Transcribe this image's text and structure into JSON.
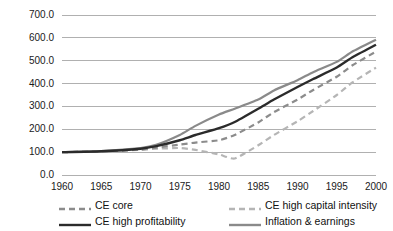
{
  "chart_data": {
    "type": "line",
    "title": "",
    "xlabel": "",
    "ylabel": "",
    "xlim": [
      1960,
      2000
    ],
    "ylim": [
      0,
      700
    ],
    "grid": true,
    "legend_position": "bottom",
    "x": [
      1960,
      1965,
      1970,
      1972,
      1975,
      1977,
      1980,
      1982,
      1985,
      1987,
      1990,
      1992,
      1995,
      1997,
      2000
    ],
    "y_ticks": [
      "0.0",
      "100.0",
      "200.0",
      "300.0",
      "400.0",
      "500.0",
      "600.0",
      "700.0"
    ],
    "y_tick_values": [
      0,
      100,
      200,
      300,
      400,
      500,
      600,
      700
    ],
    "x_ticks": [
      "1960",
      "1965",
      "1970",
      "1975",
      "1980",
      "1985",
      "1990",
      "1995",
      "2000"
    ],
    "x_tick_values": [
      1960,
      1965,
      1970,
      1975,
      1980,
      1985,
      1990,
      1995,
      2000
    ],
    "series": [
      {
        "name": "CE core",
        "style": "dashed",
        "color": "#8c8c8c",
        "width": 2.2,
        "values": [
          100,
          103,
          112,
          120,
          133,
          142,
          152,
          175,
          230,
          275,
          330,
          372,
          430,
          480,
          540
        ]
      },
      {
        "name": "CE high profitability",
        "style": "solid",
        "color": "#2b2b2b",
        "width": 2.4,
        "values": [
          100,
          104,
          115,
          126,
          152,
          175,
          205,
          232,
          290,
          330,
          385,
          420,
          470,
          515,
          570
        ]
      },
      {
        "name": "CE high capital intensity",
        "style": "dashed",
        "color": "#b5b5b5",
        "width": 2.2,
        "values": [
          100,
          103,
          110,
          115,
          118,
          110,
          90,
          72,
          130,
          175,
          235,
          280,
          350,
          405,
          470
        ]
      },
      {
        "name": "Inflation & earnings",
        "style": "solid",
        "color": "#8a8a8a",
        "width": 2.2,
        "values": [
          100,
          105,
          118,
          132,
          175,
          215,
          265,
          290,
          330,
          370,
          415,
          450,
          495,
          540,
          592
        ]
      }
    ]
  },
  "legend": {
    "entries": [
      {
        "label": "CE core",
        "style": "dashed",
        "color": "#8c8c8c"
      },
      {
        "label": "CE high capital intensity",
        "style": "dashed",
        "color": "#b5b5b5"
      },
      {
        "label": "CE high profitability",
        "style": "solid",
        "color": "#2b2b2b"
      },
      {
        "label": "Inflation & earnings",
        "style": "solid",
        "color": "#8a8a8a"
      }
    ]
  },
  "colors": {
    "gridline": "#b0b0b0",
    "axis_text": "#1a1a1a",
    "background": "#ffffff"
  }
}
